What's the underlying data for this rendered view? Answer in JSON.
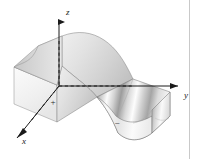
{
  "figure": {
    "kind": "3d-surface-plot",
    "background_color": "#ffffff",
    "border_color": "#c9c9c9"
  },
  "axes": {
    "z": {
      "label": "z",
      "label_x": 66,
      "label_y": 15,
      "arrow": "up"
    },
    "y": {
      "label": "y",
      "label_x": 184,
      "label_y": 98,
      "arrow": "right"
    },
    "x": {
      "label": "x",
      "label_x": 22,
      "label_y": 144,
      "arrow": "down-left"
    },
    "axis_color": "#1a1a1a",
    "hidden_line_style": "dashed"
  },
  "regions": [
    {
      "name": "positive-lobe",
      "sign_label": "+",
      "label_x": 53,
      "label_y": 105,
      "position": "upper-left hump"
    },
    {
      "name": "negative-lobe",
      "sign_label": "−",
      "label_x": 117,
      "label_y": 126,
      "position": "lower-right valley"
    }
  ],
  "surface": {
    "fill_light": "#f6f6f6",
    "fill_mid": "#d8d8d8",
    "fill_dark": "#9a9a9a",
    "edge_color": "#6e6e6e"
  }
}
